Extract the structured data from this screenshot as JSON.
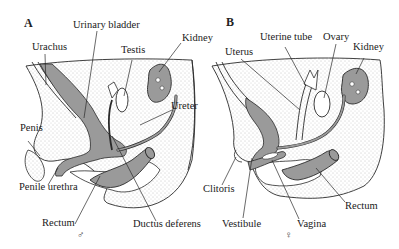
{
  "figure": {
    "panels": [
      {
        "letter": "A",
        "sex_symbol": "♂",
        "labels": {
          "urinary_bladder": "Urinary bladder",
          "urachus": "Urachus",
          "testis": "Testis",
          "kidney": "Kidney",
          "ureter": "Ureter",
          "penis": "Penis",
          "penile_urethra": "Penile urethra",
          "rectum": "Rectum",
          "ductus_deferens": "Ductus deferens"
        }
      },
      {
        "letter": "B",
        "sex_symbol": "♀",
        "labels": {
          "uterine_tube": "Uterine tube",
          "ovary": "Ovary",
          "uterus": "Uterus",
          "kidney": "Kidney",
          "clitoris": "Clitoris",
          "vestibule": "Vestibule",
          "vagina": "Vagina",
          "rectum": "Rectum"
        }
      }
    ],
    "colors": {
      "organ_fill": "#9a9a9a",
      "stipple": "#bdbdbd",
      "outline": "#2a2a2a"
    }
  }
}
